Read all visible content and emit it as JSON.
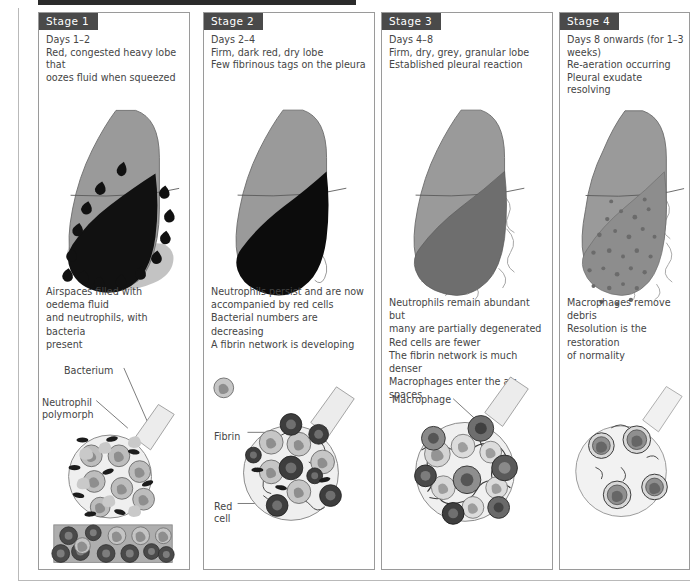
{
  "figure": {
    "title_rule": "black-bar",
    "colors": {
      "tag_bg": "#4a4a4a",
      "tag_text": "#ffffff",
      "body_text": "#454545",
      "panel_border": "#9a9a9a",
      "lung_upper_lobe": "#9a9a9a",
      "lung_stage1_consolidation": "#111111",
      "lung_stage3_grey": "#6e6e6e",
      "lung_stage4_grey": "#8d8d8d",
      "alveolus_fill": "#efefef",
      "neutrophil_fill": "#bdbdbd",
      "red_cell_fill": "#3d3d3d",
      "macrophage_fill": "#9e9e9e"
    }
  },
  "panels": [
    {
      "tag": "Stage 1",
      "description": "Days 1–2\nRed, congested heavy lobe that\noozes fluid when squeezed",
      "mid_text": "Airspaces filled with oedema fluid\nand neutrophils, with bacteria\npresent",
      "labels": [
        {
          "name": "bacterium",
          "text": "Bacterium"
        },
        {
          "name": "neutrophil-polymorph",
          "text": "Neutrophil\npolymorph"
        }
      ]
    },
    {
      "tag": "Stage 2",
      "description": "Days 2–4\nFirm, dark red, dry lobe\nFew fibrinous tags on the pleura",
      "mid_text": "Neutrophils persist and are now\naccompanied by red cells\nBacterial numbers are decreasing\nA fibrin network is developing",
      "labels": [
        {
          "name": "fibrin",
          "text": "Fibrin"
        },
        {
          "name": "red-cell",
          "text": "Red\ncell"
        }
      ]
    },
    {
      "tag": "Stage 3",
      "description": "Days 4–8\nFirm, dry, grey, granular lobe\nEstablished pleural reaction",
      "mid_text": "Neutrophils remain abundant but\nmany are partially degenerated\nRed cells are fewer\nThe fibrin network is much denser\nMacrophages enter the air spaces",
      "labels": [
        {
          "name": "macrophage",
          "text": "Macrophage"
        }
      ]
    },
    {
      "tag": "Stage 4",
      "description": "Days 8 onwards (for 1–3 weeks)\nRe-aeration occurring\nPleural exudate resolving",
      "mid_text": "Macrophages remove debris\nResolution is the restoration\nof normality",
      "labels": []
    }
  ]
}
